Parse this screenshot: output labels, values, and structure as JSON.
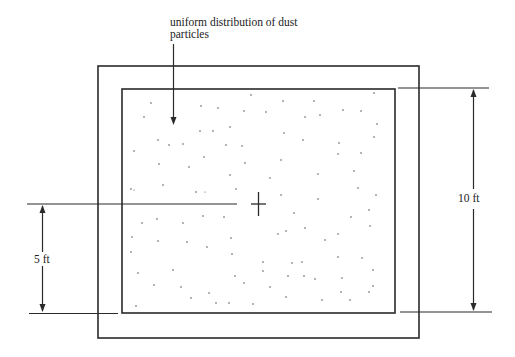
{
  "diagram": {
    "annotation": {
      "line1": "uniform distribution of dust",
      "line2": "particles"
    },
    "dimensions": {
      "left": {
        "label": "5 ft"
      },
      "right": {
        "label": "10 ft"
      }
    },
    "colors": {
      "line": "#2a2a2a",
      "dot": "#555555",
      "background": "#ffffff"
    }
  }
}
